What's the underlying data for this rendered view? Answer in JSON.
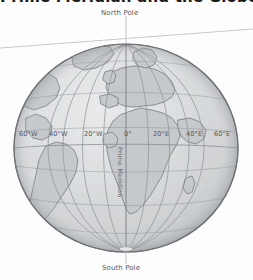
{
  "figure": {
    "title": "Prime Meridian and the Globe",
    "type": "globe-diagram",
    "projection": "orthographic",
    "center_longitude": "0",
    "background_color": "#fdfdfd",
    "ocean_color": "#d8dadc",
    "land_color": "#c9cbcd",
    "graticule_color": "#8b8e91",
    "outline_color": "#6f7276"
  },
  "annotations": {
    "north_pole": "North Pole",
    "south_pole": "South Pole",
    "prime_meridian": "Prime Meridian",
    "axis_line": "axis-reference-line"
  },
  "longitude_labels": [
    {
      "text": "60°W",
      "x": 19,
      "y": 130,
      "value": -60
    },
    {
      "text": "40°W",
      "x": 49,
      "y": 130,
      "value": -40
    },
    {
      "text": "20°W",
      "x": 84,
      "y": 130,
      "value": -20
    },
    {
      "text": "0°",
      "x": 124,
      "y": 130,
      "value": 0
    },
    {
      "text": "20°E",
      "x": 153,
      "y": 130,
      "value": 20
    },
    {
      "text": "40°E",
      "x": 186,
      "y": 130,
      "value": 40
    },
    {
      "text": "60°E",
      "x": 214,
      "y": 130,
      "value": 60
    }
  ],
  "geometry": {
    "globe_center_x": 126,
    "globe_center_y": 148,
    "globe_radius_x": 112,
    "globe_radius_y": 104,
    "north_pole_point_x": 126,
    "north_pole_point_y": 44,
    "south_pole_point_x": 126,
    "south_pole_point_y": 252,
    "axis_line_x1": 0,
    "axis_line_y1": 48,
    "axis_line_x2": 253,
    "axis_line_y2": 29
  }
}
